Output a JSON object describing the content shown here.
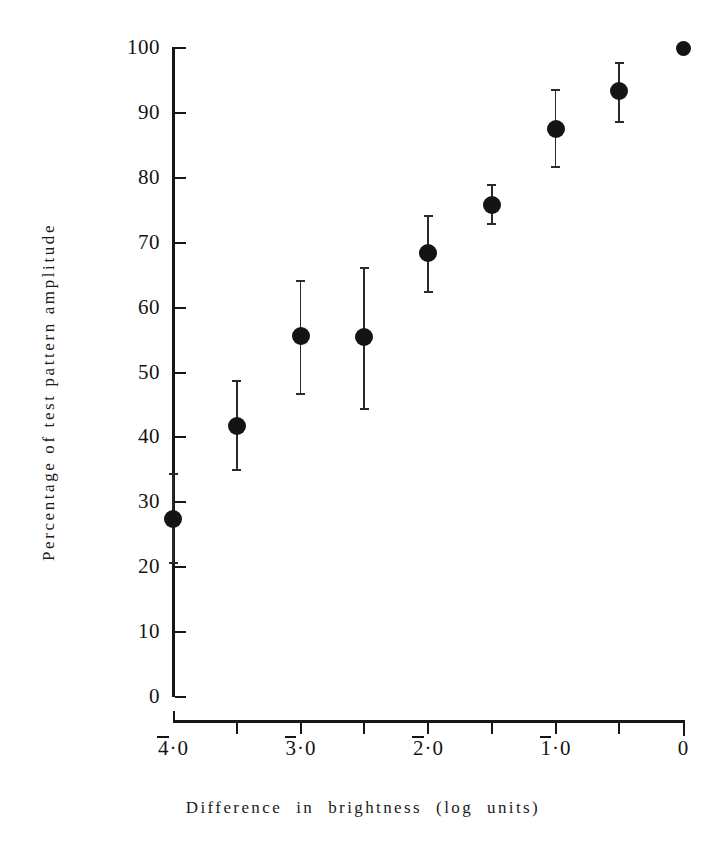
{
  "chart_data": {
    "type": "scatter",
    "title": "",
    "xlabel": "Difference in brightness (log units)",
    "ylabel": "Percentage of test pattern amplitude",
    "xlim": [
      -4.0,
      0.0
    ],
    "ylim": [
      0,
      100
    ],
    "grid": false,
    "legend": null,
    "error_bars": "vertical, with horizontal caps",
    "marker": "filled circle",
    "x_tick_values": [
      -4.0,
      -3.5,
      -3.0,
      -2.5,
      -2.0,
      -1.5,
      -1.0,
      -0.5,
      0.0
    ],
    "x_tick_labels": [
      "4̄·0",
      "",
      "3̄·0",
      "",
      "2̄·0",
      "",
      "1̄·0",
      "",
      "0"
    ],
    "y_tick_values": [
      0,
      10,
      20,
      30,
      40,
      50,
      60,
      70,
      80,
      90,
      100
    ],
    "y_tick_labels": [
      "0",
      "10",
      "20",
      "30",
      "40",
      "50",
      "60",
      "70",
      "80",
      "90",
      "100"
    ],
    "x": [
      -4.0,
      -3.5,
      -3.0,
      -2.5,
      -2.0,
      -1.5,
      -1.0,
      -0.5,
      0.0
    ],
    "values": [
      27.4,
      41.7,
      55.6,
      55.5,
      68.4,
      75.8,
      87.5,
      93.3,
      100.0
    ],
    "err_low": [
      20.5,
      34.8,
      46.6,
      44.2,
      62.3,
      72.8,
      81.5,
      88.5,
      100.0
    ],
    "err_high": [
      34.5,
      48.8,
      64.2,
      66.2,
      74.3,
      79.0,
      93.7,
      97.8,
      100.0
    ]
  },
  "axis_labels": {
    "y_title": "Percentage of test pattern amplitude",
    "x_title_words": [
      "Difference",
      "in",
      "brightness",
      "(log",
      "units)"
    ]
  },
  "style": {
    "axis_color": "#171717",
    "marker_color": "#141414",
    "error_color": "#2a2a2a",
    "background": "#ffffff"
  }
}
